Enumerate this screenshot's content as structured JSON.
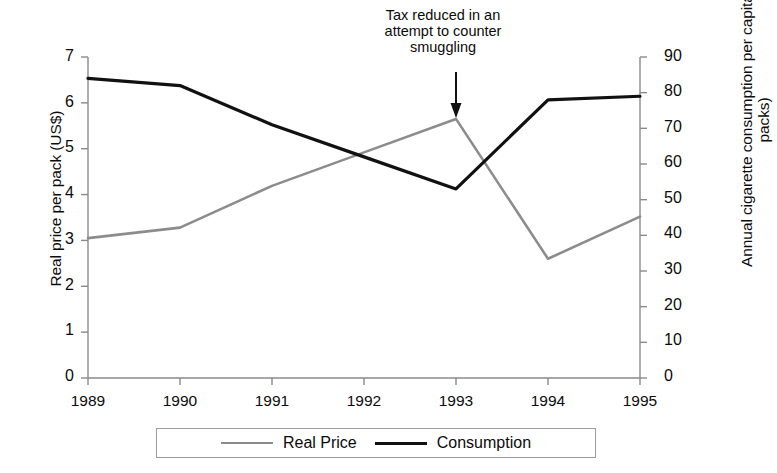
{
  "chart_data": {
    "type": "line",
    "title": "",
    "xlabel": "",
    "categories": [
      "1989",
      "1990",
      "1991",
      "1992",
      "1993",
      "1994",
      "1995"
    ],
    "x": [
      1989,
      1990,
      1991,
      1992,
      1993,
      1994,
      1995
    ],
    "series": [
      {
        "name": "Real Price",
        "axis": "left",
        "color": "#8c8c8c",
        "values": [
          3.05,
          3.28,
          4.19,
          4.92,
          5.65,
          2.6,
          3.52
        ]
      },
      {
        "name": "Consumption",
        "axis": "right",
        "color": "#111111",
        "values": [
          84,
          82,
          71,
          62,
          53,
          78,
          79
        ]
      }
    ],
    "left_axis": {
      "label": "Real price per pack (US$)",
      "ticks": [
        0,
        1,
        2,
        3,
        4,
        5,
        6,
        7
      ],
      "ylim": [
        0,
        7
      ]
    },
    "right_axis": {
      "label": "Annual cigarette consumption per capita (in packs)",
      "ticks": [
        0,
        10,
        20,
        30,
        40,
        50,
        60,
        70,
        80,
        90
      ],
      "ylim": [
        0,
        90
      ]
    },
    "grid": false,
    "legend_position": "bottom",
    "annotations": [
      {
        "text": "Tax reduced in an\nattempt to counter\nsmuggling",
        "points_to_x": 1993,
        "arrow": "down"
      }
    ]
  },
  "axes": {
    "left_title": "Real price per pack (US$)",
    "right_title": "Annual cigarette consumption per capita (in packs)",
    "left_ticks": [
      "7",
      "6",
      "5",
      "4",
      "3",
      "2",
      "1",
      "0"
    ],
    "right_ticks": [
      "90",
      "80",
      "70",
      "60",
      "50",
      "40",
      "30",
      "20",
      "10",
      "0"
    ],
    "x_ticks": [
      "1989",
      "1990",
      "1991",
      "1992",
      "1993",
      "1994",
      "1995"
    ]
  },
  "annotation": {
    "line1": "Tax reduced in an",
    "line2": "attempt to counter",
    "line3": "smuggling"
  },
  "legend": {
    "items": [
      {
        "label": "Real Price",
        "color": "#8c8c8c"
      },
      {
        "label": "Consumption",
        "color": "#111111"
      }
    ]
  }
}
